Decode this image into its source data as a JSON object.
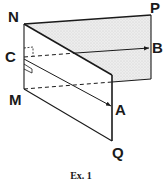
{
  "figure": {
    "caption": "Ex. 1",
    "labels": {
      "N": "N",
      "P": "P",
      "B": "B",
      "C": "C",
      "M": "M",
      "A": "A",
      "Q": "Q"
    },
    "colors": {
      "line": "#1a1a1a",
      "shaded_plane": "#e9e9e9",
      "background": "#ffffff"
    }
  }
}
